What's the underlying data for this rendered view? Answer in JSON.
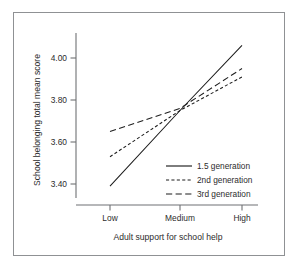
{
  "chart_data": {
    "type": "line",
    "title": "",
    "subtitle": "",
    "xlabel": "Adult support for school help",
    "ylabel": "School belonging total mean score",
    "categories": [
      "Low",
      "Medium",
      "High"
    ],
    "xtick_labels": [
      "Low",
      "Medium",
      "High"
    ],
    "ytick_labels": [
      "4.00",
      "3.80",
      "3.60",
      "3.40"
    ],
    "ytick_values": [
      4.0,
      3.8,
      3.6,
      3.4
    ],
    "ylim": [
      3.3,
      4.12
    ],
    "grid": false,
    "legend_position": "lower right",
    "series": [
      {
        "name": "1.5 generation",
        "style": "solid",
        "values": [
          3.39,
          3.75,
          4.06
        ]
      },
      {
        "name": "2nd generation",
        "style": "short-dash",
        "values": [
          3.53,
          3.75,
          3.91
        ]
      },
      {
        "name": "3rd generation",
        "style": "long-dash",
        "values": [
          3.65,
          3.76,
          3.95
        ]
      }
    ],
    "legend_entries": [
      {
        "label": "1.5 generation",
        "style": "solid"
      },
      {
        "label": "2nd generation",
        "style": "short-dash"
      },
      {
        "label": "3rd generation",
        "style": "long-dash"
      }
    ],
    "colors": {
      "line": "#1d1d1d",
      "axis": "#6f7174",
      "frame": "#8f9194",
      "text": "#2c2c2c",
      "background": "#ffffff"
    }
  },
  "axes": {
    "y_title": "School belonging total mean score",
    "x_title": "Adult support for school help",
    "y_ticks": [
      {
        "label": "4.00"
      },
      {
        "label": "3.80"
      },
      {
        "label": "3.60"
      },
      {
        "label": "3.40"
      }
    ],
    "x_ticks": [
      {
        "label": "Low"
      },
      {
        "label": "Medium"
      },
      {
        "label": "High"
      }
    ]
  },
  "legend": {
    "items": [
      {
        "label": "1.5 generation"
      },
      {
        "label": "2nd generation"
      },
      {
        "label": "3rd generation"
      }
    ]
  }
}
